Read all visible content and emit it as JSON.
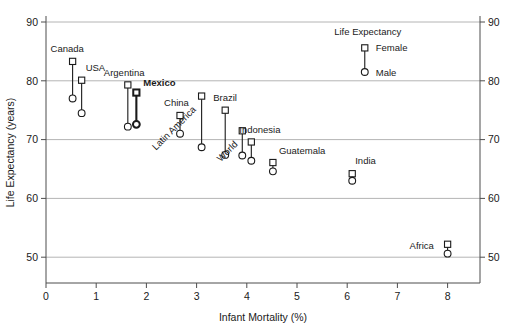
{
  "chart_data": {
    "type": "scatter",
    "title": "",
    "xlabel": "Infant Mortality (%)",
    "ylabel": "Life Expectancy (years)",
    "xlim": [
      0,
      8.7
    ],
    "ylim": [
      46.5,
      90
    ],
    "xticks": [
      0,
      1,
      2,
      3,
      4,
      5,
      6,
      7,
      8
    ],
    "xtick_labels": [
      "0",
      "1",
      "2",
      "3",
      "4",
      "5",
      "6",
      "7",
      "8"
    ],
    "yticks": [
      50,
      60,
      70,
      80,
      90
    ],
    "ytick_labels": [
      "50",
      "60",
      "70",
      "80",
      "90"
    ],
    "right_axis_labels": [
      "50",
      "60",
      "70",
      "80",
      "90"
    ],
    "grid": "horizontal",
    "legend": {
      "title": "Life Expectancy",
      "position": "top-right",
      "entries": [
        {
          "label": "Female",
          "marker": "square"
        },
        {
          "label": "Male",
          "marker": "circle"
        }
      ]
    },
    "series": [
      {
        "name": "Female",
        "marker": "square"
      },
      {
        "name": "Male",
        "marker": "circle"
      }
    ],
    "points": [
      {
        "name": "Canada",
        "x": 0.53,
        "y_female": 83.3,
        "y_male": 77.0,
        "label_dx": -22,
        "label_dy": -9,
        "rotate": 0,
        "bold": false
      },
      {
        "name": "USA",
        "x": 0.71,
        "y_female": 80.1,
        "y_male": 74.5,
        "label_dx": 4,
        "label_dy": -9,
        "rotate": 0,
        "bold": false
      },
      {
        "name": "Argentina",
        "x": 1.63,
        "y_female": 79.3,
        "y_male": 72.2,
        "label_dx": -24,
        "label_dy": -9,
        "rotate": 0,
        "bold": false
      },
      {
        "name": "Mexico",
        "x": 1.8,
        "y_female": 78.0,
        "y_male": 72.6,
        "label_dx": 7,
        "label_dy": -7,
        "rotate": 0,
        "bold": true
      },
      {
        "name": "China",
        "x": 2.67,
        "y_female": 74.1,
        "y_male": 71.0,
        "label_dx": -16,
        "label_dy": -9,
        "rotate": 0,
        "bold": false
      },
      {
        "name": "Latin America",
        "x": 3.1,
        "y_female": 77.4,
        "y_male": 68.7,
        "label_dx": -5,
        "label_dy": 14,
        "rotate": -45,
        "bold": false
      },
      {
        "name": "Brazil",
        "x": 3.57,
        "y_female": 75.0,
        "y_male": 67.4,
        "label_dx": -12,
        "label_dy": -9,
        "rotate": 0,
        "bold": false
      },
      {
        "name": "World",
        "x": 3.91,
        "y_female": 71.5,
        "y_male": 67.3,
        "label_dx": -4,
        "label_dy": 14,
        "rotate": -45,
        "bold": false
      },
      {
        "name": "Indonesia",
        "x": 4.09,
        "y_female": 69.6,
        "y_male": 66.4,
        "label_dx": -12,
        "label_dy": -9,
        "rotate": 0,
        "bold": false
      },
      {
        "name": "Guatemala",
        "x": 4.52,
        "y_female": 66.1,
        "y_male": 64.6,
        "label_dx": 6,
        "label_dy": -9,
        "rotate": 0,
        "bold": false
      },
      {
        "name": "India",
        "x": 6.1,
        "y_female": 64.2,
        "y_male": 63.0,
        "label_dx": 3,
        "label_dy": -10,
        "rotate": 0,
        "bold": false
      },
      {
        "name": "Africa",
        "x": 8.0,
        "y_female": 52.2,
        "y_male": 50.6,
        "label_dx": -38,
        "label_dy": 5,
        "rotate": 0,
        "bold": false
      }
    ],
    "legend_marker_values": {
      "female_y": 85.6,
      "male_y": 81.5,
      "x": 6.35
    }
  }
}
